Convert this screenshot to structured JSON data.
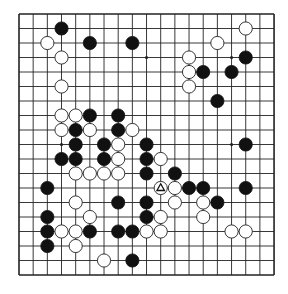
{
  "board": {
    "size": 19,
    "origin_x": 19,
    "origin_y": 14,
    "step_x": 14.17,
    "step_y": 14.5,
    "line_color": "#222222",
    "background": "#ffffff",
    "hoshi": [
      [
        3,
        3
      ],
      [
        9,
        3
      ],
      [
        15,
        3
      ],
      [
        3,
        9
      ],
      [
        9,
        9
      ],
      [
        15,
        9
      ],
      [
        3,
        15
      ],
      [
        9,
        15
      ],
      [
        15,
        15
      ]
    ]
  },
  "stones": {
    "black": [
      [
        3,
        1
      ],
      [
        5,
        2
      ],
      [
        8,
        2
      ],
      [
        16,
        3
      ],
      [
        13,
        4
      ],
      [
        15,
        4
      ],
      [
        14,
        6
      ],
      [
        5,
        7
      ],
      [
        7,
        7
      ],
      [
        4,
        8
      ],
      [
        7,
        8
      ],
      [
        4,
        9
      ],
      [
        6,
        9
      ],
      [
        9,
        9
      ],
      [
        16,
        9
      ],
      [
        3,
        10
      ],
      [
        4,
        10
      ],
      [
        6,
        10
      ],
      [
        9,
        10
      ],
      [
        9,
        11
      ],
      [
        11,
        11
      ],
      [
        2,
        12
      ],
      [
        12,
        12
      ],
      [
        13,
        12
      ],
      [
        16,
        12
      ],
      [
        7,
        13
      ],
      [
        9,
        13
      ],
      [
        14,
        13
      ],
      [
        2,
        14
      ],
      [
        9,
        14
      ],
      [
        2,
        15
      ],
      [
        5,
        15
      ],
      [
        7,
        15
      ],
      [
        8,
        15
      ],
      [
        2,
        16
      ],
      [
        8,
        17
      ]
    ],
    "white": [
      [
        16,
        1
      ],
      [
        2,
        2
      ],
      [
        14,
        2
      ],
      [
        3,
        3
      ],
      [
        12,
        3
      ],
      [
        12,
        4
      ],
      [
        3,
        5
      ],
      [
        12,
        5
      ],
      [
        3,
        7
      ],
      [
        4,
        7
      ],
      [
        3,
        8
      ],
      [
        5,
        8
      ],
      [
        8,
        8
      ],
      [
        7,
        9
      ],
      [
        7,
        10
      ],
      [
        10,
        10
      ],
      [
        4,
        11
      ],
      [
        5,
        11
      ],
      [
        6,
        11
      ],
      [
        7,
        11
      ],
      [
        10,
        12
      ],
      [
        11,
        12
      ],
      [
        4,
        13
      ],
      [
        11,
        13
      ],
      [
        13,
        13
      ],
      [
        5,
        14
      ],
      [
        10,
        14
      ],
      [
        13,
        14
      ],
      [
        3,
        15
      ],
      [
        4,
        15
      ],
      [
        9,
        15
      ],
      [
        10,
        15
      ],
      [
        15,
        15
      ],
      [
        16,
        15
      ],
      [
        4,
        16
      ],
      [
        6,
        17
      ]
    ]
  },
  "markers": [
    {
      "type": "triangle",
      "point": [
        10,
        12
      ],
      "on": "white"
    }
  ]
}
